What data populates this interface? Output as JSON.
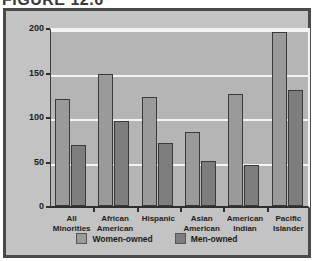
{
  "figure": {
    "title": "FIGURE 12.6"
  },
  "chart_data": {
    "type": "bar",
    "title": "FIGURE 12.6",
    "xlabel": "",
    "ylabel": "PERCENT GROWTH",
    "ylim": [
      0,
      200
    ],
    "yticks": [
      0,
      50,
      100,
      150,
      200
    ],
    "ytick_labels": [
      "0",
      "50",
      "100",
      "150",
      "200"
    ],
    "grid": true,
    "legend_position": "bottom",
    "categories": [
      "All\nMinorities",
      "African\nAmerican",
      "Hispanic",
      "Asian\nAmerican",
      "American\nIndian",
      "Pacific\nIslander"
    ],
    "series": [
      {
        "name": "Women-owned",
        "color": "#9a9a9a",
        "values": [
          120,
          148,
          122,
          83,
          126,
          195
        ]
      },
      {
        "name": "Men-owned",
        "color": "#7d7d7d",
        "values": [
          68,
          96,
          71,
          51,
          46,
          130
        ]
      }
    ]
  },
  "legend": {
    "entries": [
      {
        "label": "Women-owned"
      },
      {
        "label": "Men-owned"
      }
    ]
  },
  "colors": {
    "plot_background": "#b5b5b5",
    "card_background": "#c3c3c3",
    "gridline": "#f4f4f4",
    "frame": "#4a4a4a",
    "women_bar": "#9a9a9a",
    "men_bar": "#7d7d7d"
  }
}
